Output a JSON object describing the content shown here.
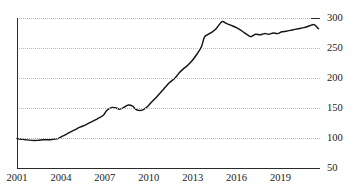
{
  "chart_data": {
    "type": "line",
    "title": "",
    "subtitle": "",
    "xlabel": "",
    "ylabel": "",
    "xlim": [
      2001,
      2021.7
    ],
    "ylim": [
      50,
      300
    ],
    "grid": true,
    "grid_style": "dotted-horizontal",
    "legend": false,
    "legend_position": "none",
    "line_color": "#151515",
    "axis_color": "#2b2b2b",
    "grid_color": "#b9b9b9",
    "ytick_labels": [
      "300",
      "250",
      "200",
      "150",
      "100",
      "50"
    ],
    "ytick_values": [
      300,
      250,
      200,
      150,
      100,
      50
    ],
    "xtick_labels": [
      "2001",
      "2004",
      "2007",
      "2010",
      "2013",
      "2016",
      "2019"
    ],
    "xtick_values": [
      2001,
      2004,
      2007,
      2010,
      2013,
      2016,
      2019
    ],
    "series": [
      {
        "name": "index",
        "x": [
          2001.0,
          2001.3,
          2001.6,
          2002.0,
          2002.4,
          2002.8,
          2003.1,
          2003.5,
          2003.8,
          2004.1,
          2004.5,
          2004.9,
          2005.3,
          2005.7,
          2006.1,
          2006.5,
          2006.9,
          2007.1,
          2007.3,
          2007.5,
          2007.8,
          2008.0,
          2008.3,
          2008.6,
          2008.9,
          2009.1,
          2009.3,
          2009.6,
          2009.9,
          2010.2,
          2010.6,
          2011.0,
          2011.4,
          2011.8,
          2012.1,
          2012.4,
          2012.7,
          2013.0,
          2013.3,
          2013.6,
          2013.8,
          2014.0,
          2014.3,
          2014.6,
          2015.0,
          2015.3,
          2015.6,
          2015.9,
          2016.2,
          2016.5,
          2016.8,
          2017.0,
          2017.3,
          2017.6,
          2017.9,
          2018.2,
          2018.5,
          2018.8,
          2019.1,
          2019.4,
          2019.8,
          2020.2,
          2020.6,
          2021.0,
          2021.3,
          2021.6
        ],
        "values": [
          99,
          98,
          97,
          96,
          96,
          97,
          97,
          98,
          99,
          103,
          108,
          113,
          118,
          122,
          127,
          132,
          138,
          145,
          149,
          151,
          150,
          148,
          151,
          155,
          153,
          148,
          146,
          147,
          152,
          160,
          170,
          181,
          192,
          200,
          209,
          216,
          222,
          230,
          240,
          252,
          268,
          272,
          276,
          282,
          294,
          291,
          288,
          285,
          281,
          276,
          271,
          269,
          273,
          272,
          274,
          273,
          275,
          274,
          277,
          278,
          280,
          282,
          284,
          287,
          289,
          282
        ]
      }
    ]
  }
}
